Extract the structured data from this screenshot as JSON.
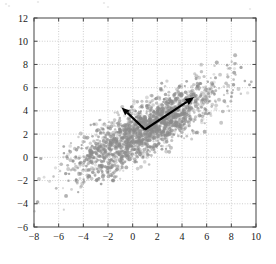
{
  "figure": {
    "kind": "scatter-with-principal-axes",
    "background": "#ffffff",
    "point_color": "#8c8c8c",
    "arrow_color": "#000000",
    "grid_color": "#b9b9b9",
    "frame_color": "#555555"
  },
  "axes": {
    "x_ticks": [
      "-8",
      "-6",
      "-4",
      "-2",
      "0",
      "2",
      "4",
      "6",
      "8",
      "10"
    ],
    "y_ticks": [
      "-6",
      "-4",
      "-2",
      "0",
      "2",
      "4",
      "6",
      "8",
      "10",
      "12"
    ]
  },
  "chart_data": {
    "type": "scatter",
    "title": "",
    "xlabel": "",
    "ylabel": "",
    "xlim": [
      -8,
      10
    ],
    "ylim": [
      -6,
      12
    ],
    "xticks": [
      -8,
      -6,
      -4,
      -2,
      0,
      2,
      4,
      6,
      8,
      10
    ],
    "yticks": [
      -6,
      -4,
      -2,
      0,
      2,
      4,
      6,
      8,
      10,
      12
    ],
    "grid": true,
    "legend": "none",
    "marker": {
      "shape": "circle",
      "size": 1.6,
      "color": "#8c8c8c",
      "alpha": 0.45
    },
    "distribution": {
      "family": "bivariate-normal",
      "n_points": 3000,
      "mean": [
        1.0,
        2.4
      ],
      "std": [
        2.9,
        2.0
      ],
      "correlation": 0.82
    },
    "annotations": [
      {
        "name": "principal-component-1",
        "type": "arrow",
        "from": [
          1.0,
          2.4
        ],
        "to": [
          5.0,
          5.2
        ],
        "length_units": 4.88,
        "angle_deg": 35
      },
      {
        "name": "principal-component-2",
        "type": "arrow",
        "from": [
          1.0,
          2.4
        ],
        "to": [
          -0.9,
          4.3
        ],
        "length_units": 2.69,
        "angle_deg": 135
      }
    ],
    "series": [
      {
        "name": "samples",
        "x": [
          1.0
        ],
        "y": [
          2.4
        ],
        "note": "cloud generated from distribution parameters above"
      }
    ]
  }
}
